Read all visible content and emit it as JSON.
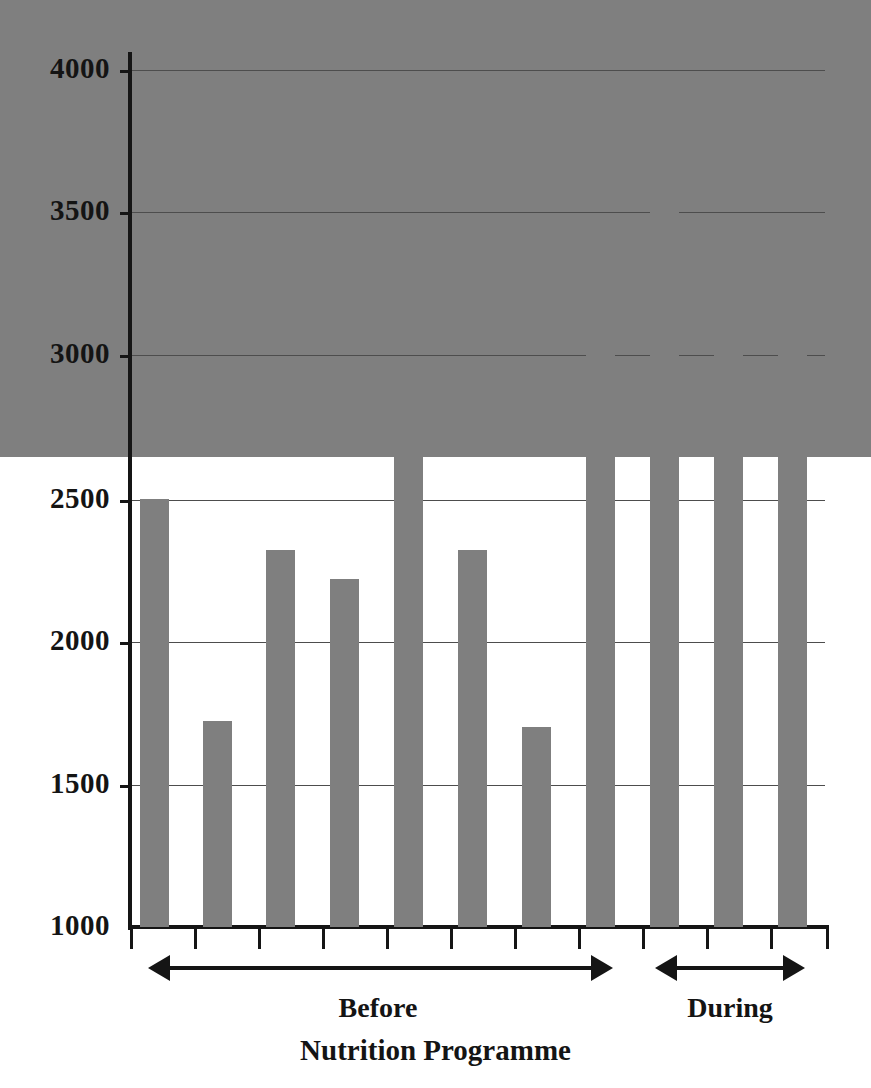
{
  "chart_data": {
    "type": "bar",
    "title": "",
    "xlabel": "Nutrition Programme",
    "ylabel": "",
    "categories": [
      "1",
      "2",
      "3",
      "4",
      "5",
      "6",
      "7",
      "8",
      "9",
      "10",
      "11"
    ],
    "values": [
      2600,
      2500,
      1720,
      2320,
      2220,
      2720,
      2320,
      1700,
      3220,
      3720,
      3430
    ],
    "series": [
      {
        "name": "Energy intake",
        "values": [
          2600,
          2500,
          1720,
          2320,
          2220,
          2720,
          2320,
          1700,
          3220,
          3720,
          3430
        ]
      }
    ],
    "ylim": [
      1000,
      4000
    ],
    "y_ticks": [
      1000,
      1500,
      2000,
      2500,
      3000,
      3500,
      4000
    ],
    "y_tick_labels": [
      "1000",
      "1500",
      "2000",
      "2500",
      "3000",
      "3500",
      "4000"
    ],
    "grid": true,
    "legend": "none",
    "bar_color": "#7f7f7f",
    "axis_color": "#151515",
    "gridline_color": "#4d4d4d",
    "background_color": "#ffffff",
    "groups": [
      {
        "label": "Before",
        "bar_indices": [
          0,
          1,
          2,
          3,
          4,
          5,
          6,
          7
        ],
        "arrow": "double-headed"
      },
      {
        "label": "During",
        "bar_indices": [
          8,
          9,
          10
        ],
        "arrow": "double-headed"
      }
    ],
    "annotations": [
      "Before",
      "During",
      "Nutrition Programme"
    ]
  },
  "axis": {
    "x_title": "Nutrition Programme",
    "y_tick_labels": [
      "4000",
      "3500",
      "3000",
      "2500",
      "2000",
      "1500",
      "1000"
    ]
  },
  "groups": {
    "before": {
      "label": "Before"
    },
    "during": {
      "label": "During"
    }
  }
}
